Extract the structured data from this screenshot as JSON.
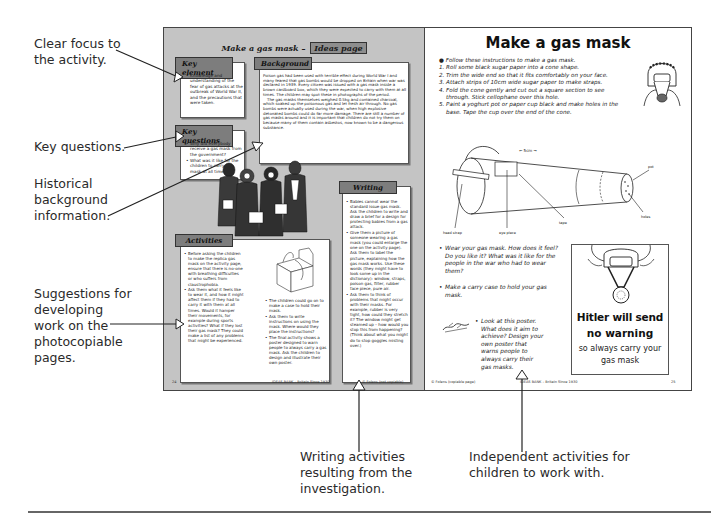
{
  "annotations": {
    "clear_focus": [
      "Clear focus to",
      "the activity."
    ],
    "key_questions": [
      "Key questions."
    ],
    "historical": [
      "Historical",
      "background",
      "information."
    ],
    "suggestions": [
      "Suggestions for",
      "developing",
      "work on the",
      "photocopiable",
      "pages."
    ],
    "writing_activities": [
      "Writing activities",
      "resulting from the",
      "investigation."
    ],
    "independent": [
      "Independent activities for",
      "children to work with."
    ]
  },
  "left_page": {
    "header_title": "Make a gas mask –",
    "header_tag": "Ideas page",
    "key_element": {
      "label": "Key element",
      "items": [
        "Knowledge and understanding of the fear of gas attacks at the outbreak of World War II, and the precautions that were taken."
      ]
    },
    "key_questions": {
      "label": "Key questions",
      "items": [
        "Why did everybody receive a gas mask from the government?",
        "What was it like for the children to carry the mask at all times?"
      ]
    },
    "background": {
      "label": "Background",
      "paragraphs": [
        "Poison gas had been used with terrible effect during World War I and many feared that gas bombs would be dropped on Britain when war was declared in 1939. Every citizen was issued with a gas mask inside a brown cardboard box, which they were expected to carry with them at all times. The children may spot these in photographs of the period.",
        "The gas masks themselves weighed 0.5kg and contained charcoal, which soaked up the poisonous gas and let fresh air through. No gas bombs were actually used during the war, when high explosive detonated bombs could do far more damage. There are still a number of gas masks around and it is important that children do not try them on because many of them contain asbestos, now known to be a dangerous substance."
      ]
    },
    "writing": {
      "label": "Writing",
      "items": [
        "Babies cannot wear the standard issue gas mask. Ask the children to write and draw a brief for a design for protecting babies from a gas attack.",
        "Give them a picture of someone wearing a gas mask (you could enlarge the one on the activity page). Ask them to label the picture, explaining how the gas mask works. Use these words (they might have to look some up in the dictionary): window, straps, poison gas, filter, rubber face piece, pure air.",
        "Ask them to think of problems that might occur with their masks. For example, rubber is very tight, how could they stretch it? The window might get steamed up – how would you stop this from happening? (Think about what you might do to stop goggles misting over.)"
      ]
    },
    "activities": {
      "label": "Activities",
      "left_items": [
        "Before asking the children to make the replica gas mask on the activity page, ensure that there is no-one with breathing difficulties or who suffers from claustrophobia.",
        "Ask them what it feels like to wear it, and how it might affect them if they had to carry it with them at all times. Would it hamper their movements, for example during sports activities? What if they lost their gas mask? They could make a list of any problems that might be experienced."
      ],
      "right_items": [
        "The children could go on to make a case to hold their mask.",
        "Ask them to write instructions on using the mask. Where would they place the instructions?",
        "The final activity shows a poster designed to warn people to always carry a gas mask. Ask the children to design and illustrate their own poster."
      ]
    },
    "footer": {
      "page_number": "24",
      "center": "IDEAS BANK – Britain Since 1930",
      "right": "© Folens (not copiable)"
    }
  },
  "right_page": {
    "title": "Make a gas mask",
    "intro": "Follow these instructions to make a gas mask.",
    "steps": [
      "1. Roll some black sugar paper into a cone shape.",
      "2. Trim the wide end so that it fits comfortably on your face.",
      "3. Attach strips of 10cm wide sugar paper to make straps.",
      "4. Fold the cone gently and cut out a square section to see",
      "    through. Stick cellophane over this hole.",
      "5. Paint a yoghurt pot or paper cup black and make holes in the",
      "    base. Tape the cup over the end of the cone."
    ],
    "diagram_labels": {
      "dimension": "← 5cm →",
      "head_strap": "head strap",
      "eye_piece": "eye piece",
      "tape": "tape",
      "pot": "pot",
      "holes": "holes"
    },
    "questions": [
      "Wear your gas mask. How does it feel? Do you like it? What was it like for the people in the war who had to wear them?",
      "Make a carry case to hold your gas mask."
    ],
    "poster_task": "Look at this poster. What does it aim to achieve? Design your own poster that warns people to always carry their gas masks.",
    "poster": {
      "line1": "Hitler will send",
      "line2": "no warning",
      "line3": "so always carry your",
      "line4": "gas mask"
    },
    "footer": {
      "left": "© Folens (copiable page)",
      "center": "IDEAS BANK – Britain Since 1930",
      "page_number": "25"
    }
  }
}
